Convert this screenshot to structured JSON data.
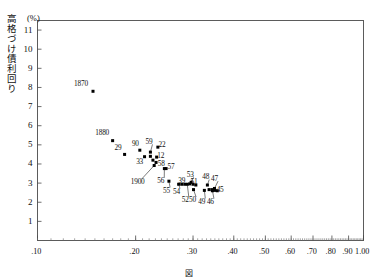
{
  "figure": {
    "unit_label": "(%)",
    "ylabel": "高格づけ債利回り",
    "caption": "図　　　　　　　　　　　　　　　　　　　　　　　　"
  },
  "chart_data": {
    "type": "scatter",
    "title": "",
    "xlabel": "",
    "ylabel": "高格づけ債利回り",
    "yunit": "(%)",
    "xscale": "log",
    "yscale": "linear",
    "xlim": [
      0.1,
      1.0
    ],
    "ylim": [
      0,
      11.5
    ],
    "grid": false,
    "legend": "none",
    "xticks": [
      0.1,
      0.2,
      0.3,
      0.4,
      0.5,
      0.6,
      0.7,
      0.8,
      0.9,
      1.0
    ],
    "xticklabels": [
      ".10",
      ".20",
      ".30",
      ".40",
      ".50",
      ".60",
      ".70",
      ".80",
      ".90",
      "1.00"
    ],
    "yticks": [
      1,
      2,
      3,
      4,
      5,
      6,
      7,
      8,
      9,
      10,
      11
    ],
    "yticklabels": [
      "1",
      "2",
      "3",
      "4",
      "5",
      "6",
      "7",
      "8",
      "9",
      "10",
      "11"
    ],
    "points": [
      {
        "label": "1870",
        "x": 0.148,
        "y": 7.8,
        "lx": 0.136,
        "ly": 8.2,
        "leader": false
      },
      {
        "label": "1880",
        "x": 0.17,
        "y": 5.22,
        "lx": 0.158,
        "ly": 5.62,
        "leader": false
      },
      {
        "label": "29",
        "x": 0.185,
        "y": 4.5,
        "lx": 0.176,
        "ly": 4.86,
        "leader": false
      },
      {
        "label": "90",
        "x": 0.206,
        "y": 4.72,
        "lx": 0.199,
        "ly": 5.06,
        "leader": false
      },
      {
        "label": "59",
        "x": 0.222,
        "y": 4.62,
        "lx": 0.219,
        "ly": 5.18,
        "leader": true
      },
      {
        "label": "22",
        "x": 0.234,
        "y": 4.88,
        "lx": 0.24,
        "ly": 5.02,
        "leader": false
      },
      {
        "label": "33",
        "x": 0.213,
        "y": 4.38,
        "lx": 0.205,
        "ly": 4.12,
        "leader": false
      },
      {
        "label": "12",
        "x": 0.232,
        "y": 4.36,
        "lx": 0.238,
        "ly": 4.46,
        "leader": false
      },
      {
        "label": "58",
        "x": 0.231,
        "y": 4.08,
        "lx": 0.239,
        "ly": 4.02,
        "leader": false
      },
      {
        "label": "1900",
        "x": 0.228,
        "y": 3.92,
        "lx": 0.203,
        "ly": 3.06,
        "leader": true
      },
      {
        "label": "57",
        "x": 0.248,
        "y": 3.76,
        "lx": 0.256,
        "ly": 3.88,
        "leader": false
      },
      {
        "label": "56",
        "x": 0.245,
        "y": 3.76,
        "lx": 0.238,
        "ly": 3.12,
        "leader": true
      },
      {
        "label": "55",
        "x": 0.253,
        "y": 3.1,
        "lx": 0.248,
        "ly": 2.62,
        "leader": true
      },
      {
        "label": "54",
        "x": 0.271,
        "y": 2.94,
        "lx": 0.266,
        "ly": 2.56,
        "leader": true
      },
      {
        "label": "39",
        "x": 0.277,
        "y": 2.94,
        "lx": 0.276,
        "ly": 3.12,
        "leader": false
      },
      {
        "label": "52",
        "x": 0.288,
        "y": 2.94,
        "lx": 0.283,
        "ly": 2.12,
        "leader": true
      },
      {
        "label": "53",
        "x": 0.296,
        "y": 3.04,
        "lx": 0.293,
        "ly": 3.46,
        "leader": true
      },
      {
        "label": "51",
        "x": 0.3,
        "y": 2.94,
        "lx": 0.301,
        "ly": 3.1,
        "leader": false
      },
      {
        "label": "50",
        "x": 0.301,
        "y": 2.66,
        "lx": 0.298,
        "ly": 2.12,
        "leader": true
      },
      {
        "label": "49",
        "x": 0.325,
        "y": 2.62,
        "lx": 0.318,
        "ly": 2.04,
        "leader": true
      },
      {
        "label": "48",
        "x": 0.332,
        "y": 2.9,
        "lx": 0.327,
        "ly": 3.34,
        "leader": true
      },
      {
        "label": "46",
        "x": 0.344,
        "y": 2.6,
        "lx": 0.338,
        "ly": 2.04,
        "leader": true
      },
      {
        "label": "47",
        "x": 0.349,
        "y": 2.72,
        "lx": 0.348,
        "ly": 3.26,
        "leader": true
      },
      {
        "label": "45",
        "x": 0.356,
        "y": 2.6,
        "lx": 0.362,
        "ly": 2.66,
        "leader": false
      }
    ],
    "extra_points": [
      {
        "x": 0.222,
        "y": 4.4
      },
      {
        "x": 0.226,
        "y": 4.2
      },
      {
        "x": 0.283,
        "y": 2.94
      },
      {
        "x": 0.293,
        "y": 2.96
      },
      {
        "x": 0.306,
        "y": 2.9
      },
      {
        "x": 0.336,
        "y": 2.66
      },
      {
        "x": 0.343,
        "y": 2.66
      },
      {
        "x": 0.35,
        "y": 2.62
      }
    ]
  }
}
